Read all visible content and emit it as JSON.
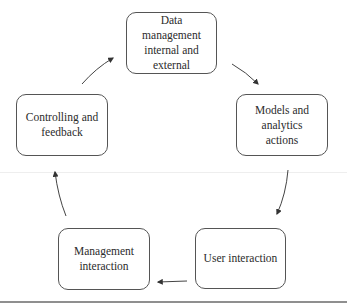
{
  "diagram": {
    "type": "cycle",
    "direction": "clockwise",
    "nodes": [
      {
        "id": "data",
        "label": "Data management internal and external"
      },
      {
        "id": "models",
        "label": "Models and analytics actions"
      },
      {
        "id": "user",
        "label": "User interaction"
      },
      {
        "id": "management",
        "label": "Management interaction"
      },
      {
        "id": "controlling",
        "label": "Controlling and feedback"
      }
    ],
    "edges": [
      {
        "from": "data",
        "to": "models"
      },
      {
        "from": "models",
        "to": "user"
      },
      {
        "from": "user",
        "to": "management"
      },
      {
        "from": "management",
        "to": "controlling"
      },
      {
        "from": "controlling",
        "to": "data"
      }
    ],
    "colors": {
      "stroke": "#555555",
      "arrow": "#333333",
      "rule": "#8f8f8f"
    }
  }
}
